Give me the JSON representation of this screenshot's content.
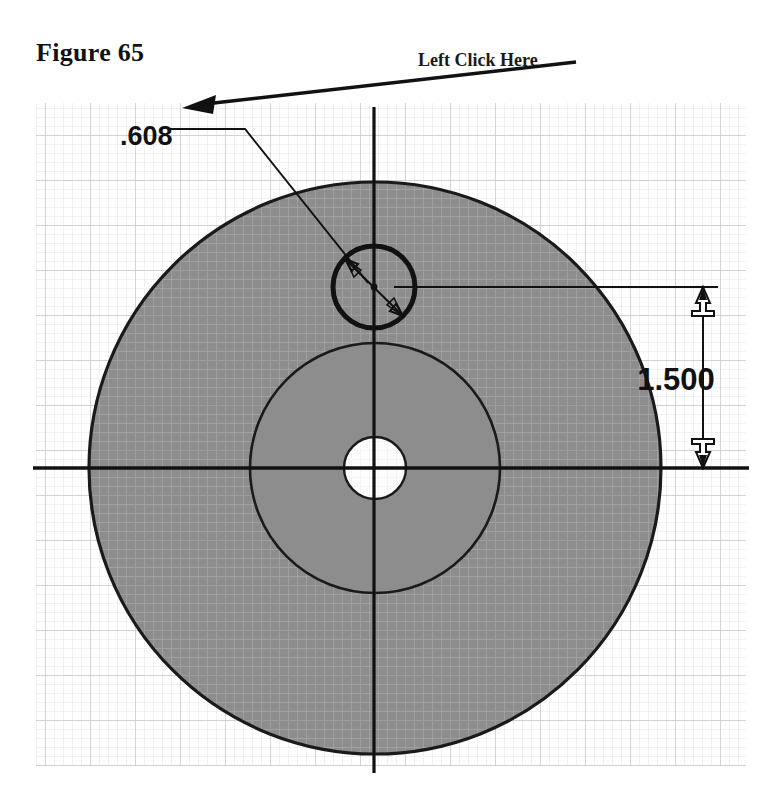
{
  "page": {
    "background_color": "#ffffff",
    "figure_caption": "Figure 65",
    "callout_note": "Left Click Here"
  },
  "drawing": {
    "title": "Circular part top view with grid background",
    "grid": {
      "minor_color": "#e8e8e8",
      "major_color": "#c9c9c9",
      "minor_spacing_px": 9,
      "major_every": 5,
      "left": 36,
      "top": 103,
      "right": 746,
      "bottom": 766
    },
    "colors": {
      "part_fill": "#8d8d8d",
      "hub_fill": "#8d8d8d",
      "bore_fill": "#fdfdfd",
      "outline": "#1a1a1a",
      "centerline": "#111111",
      "hatch_overlay": "#a9a9a9",
      "dimension_line": "#111111"
    },
    "geometry": {
      "center_x": 375,
      "center_y": 468,
      "outer_radius": 286,
      "hub_radius": 125,
      "bore_radius": 31,
      "hole_center_x": 374,
      "hole_center_y": 287,
      "hole_radius": 41
    },
    "centerlines": {
      "horizontal_y": 468,
      "horizontal_x1": 33,
      "horizontal_x2": 749,
      "vertical_x": 374,
      "vertical_y1": 107,
      "vertical_y2": 773
    },
    "dimensions": [
      {
        "name": "hole-diameter",
        "label": ".608",
        "label_x": 120,
        "label_y": 137,
        "leader_horizontal_to_x": 245,
        "leader_elbow_x": 245,
        "leader_elbow_y": 129,
        "arrow_style": "double-arrow-inside-circle"
      },
      {
        "name": "hole-to-center-distance",
        "label": "1.500",
        "label_x": 712,
        "label_y": 380,
        "dimension_line_x": 703,
        "top_y": 287,
        "bottom_y": 468,
        "extension_top_x1": 394,
        "extension_top_x2": 718,
        "extension_bottom_x1": 394,
        "extension_bottom_x2": 749,
        "arrow_style": "open-arrowheads"
      }
    ],
    "callout_arrow": {
      "name": "left-click-here-arrow",
      "tail_x": 576,
      "tail_y": 63,
      "head_x": 184,
      "head_y": 108
    }
  }
}
